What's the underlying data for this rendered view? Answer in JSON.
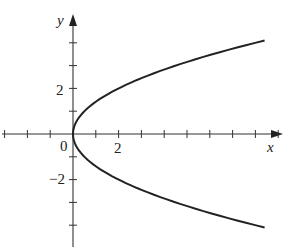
{
  "chart_data": {
    "type": "line",
    "title": "",
    "xlabel": "x",
    "ylabel": "y",
    "equation": "x = y^2 / 2",
    "xlim": [
      -3.2,
      9.2
    ],
    "ylim": [
      -5,
      5.2
    ],
    "x_ticks": [
      -3,
      -2,
      -1,
      0,
      1,
      2,
      3,
      4,
      5,
      6,
      7,
      8,
      9
    ],
    "y_ticks": [
      -4,
      -3,
      -2,
      -1,
      1,
      2,
      3,
      4
    ],
    "x_tick_labels": [
      {
        "value": 0,
        "label": "0"
      },
      {
        "value": 2,
        "label": "2"
      }
    ],
    "y_tick_labels": [
      {
        "value": 2,
        "label": "2"
      },
      {
        "value": -2,
        "label": "−2"
      }
    ],
    "grid": false,
    "legend": null,
    "series": [
      {
        "name": "parabola",
        "color": "#222222",
        "points": [
          {
            "x": 8.4,
            "y": 4.1
          },
          {
            "x": 8.0,
            "y": 4.0
          },
          {
            "x": 4.5,
            "y": 3.0
          },
          {
            "x": 2.0,
            "y": 2.0
          },
          {
            "x": 0.5,
            "y": 1.0
          },
          {
            "x": 0.0,
            "y": 0.0
          },
          {
            "x": 0.5,
            "y": -1.0
          },
          {
            "x": 2.0,
            "y": -2.0
          },
          {
            "x": 4.5,
            "y": -3.0
          },
          {
            "x": 8.0,
            "y": -4.0
          },
          {
            "x": 8.4,
            "y": -4.1
          }
        ]
      }
    ]
  },
  "labels": {
    "x_axis": "x",
    "y_axis": "y",
    "origin": "0",
    "x_two": "2",
    "y_two": "2",
    "y_neg_two": "−2"
  }
}
